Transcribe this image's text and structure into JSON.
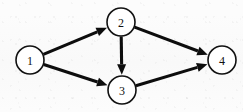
{
  "diagram": {
    "type": "directed-graph",
    "background_color": "#fcfcfc",
    "line_color": "#0d0d0d",
    "node_fill": "#ffffff",
    "node_stroke": "#111111",
    "canvas": {
      "width": 243,
      "height": 112
    },
    "nodes": [
      {
        "id": "1",
        "label": "1",
        "cx": 30,
        "cy": 60,
        "r": 14
      },
      {
        "id": "2",
        "label": "2",
        "cx": 121,
        "cy": 22,
        "r": 14
      },
      {
        "id": "3",
        "label": "3",
        "cx": 122,
        "cy": 90,
        "r": 14
      },
      {
        "id": "4",
        "label": "4",
        "cx": 222,
        "cy": 60,
        "r": 14
      }
    ],
    "edges": [
      {
        "id": "e1",
        "from": "1",
        "to": "2",
        "directed": true,
        "arrowhead": "solid"
      },
      {
        "id": "e2",
        "from": "1",
        "to": "3",
        "directed": true,
        "arrowhead": "solid"
      },
      {
        "id": "e3",
        "from": "2",
        "to": "3",
        "directed": true,
        "arrowhead": "solid"
      },
      {
        "id": "e4",
        "from": "2",
        "to": "4",
        "directed": true,
        "arrowhead": "solid"
      },
      {
        "id": "e5",
        "from": "3",
        "to": "4",
        "directed": true,
        "arrowhead": "solid"
      }
    ]
  }
}
